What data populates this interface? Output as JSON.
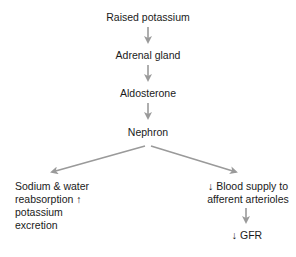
{
  "diagram": {
    "type": "flowchart",
    "arrow_color": "#9a9a9a",
    "nodes": {
      "n1": "Raised potassium",
      "n2": "Adrenal gland",
      "n3": "Aldosterone",
      "n4": "Nephron",
      "left_line1": "Sodium & water",
      "left_line2": "reabsorption ↑",
      "left_line3": "potassium",
      "left_line4": "excretion",
      "right_line1": "↓ Blood supply to",
      "right_line2": "afferent arterioles",
      "n7": "↓ GFR"
    },
    "edges": [
      [
        "Raised potassium",
        "Adrenal gland"
      ],
      [
        "Adrenal gland",
        "Aldosterone"
      ],
      [
        "Aldosterone",
        "Nephron"
      ],
      [
        "Nephron",
        "Sodium & water reabsorption ↑ potassium excretion"
      ],
      [
        "Nephron",
        "↓ Blood supply to afferent arterioles"
      ],
      [
        "↓ Blood supply to afferent arterioles",
        "↓ GFR"
      ]
    ]
  }
}
